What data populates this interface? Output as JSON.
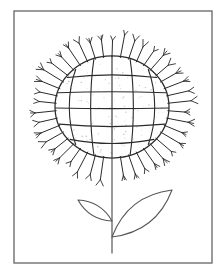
{
  "artwork": {
    "title": "Flower Line Drawing",
    "subject": "sunflower",
    "style": "hand-drawn black ink line art on white paper",
    "caption": "",
    "canvas": {
      "width": 223,
      "height": 276,
      "background": "#ffffff"
    },
    "colors": {
      "ink": "#2b2b2b",
      "ink_light": "#555555",
      "frame": "#6f6f6f",
      "paper": "#ffffff",
      "speckle": "#9a9a9a"
    }
  },
  "frame": {
    "label": "picture border",
    "x": 14,
    "y": 11,
    "width": 198,
    "height": 252,
    "stroke_width": 1.4
  },
  "flower_head": {
    "label": "flower head",
    "center_x": 112,
    "center_y": 107,
    "radius_x": 57,
    "radius_y": 51,
    "stroke_width": 1.1,
    "meridian_count": 4,
    "latitude_count": 4,
    "meridian_offsets": [
      -38,
      -19,
      0,
      19,
      38
    ],
    "latitude_offsets": [
      -31,
      -15,
      1,
      18,
      34
    ],
    "speckle_count": 120
  },
  "petals": {
    "label": "petal ring",
    "count": 42,
    "inner_radius_x": 56,
    "inner_radius_y": 50,
    "length_min": 16,
    "length_max": 24,
    "fork_length": 6,
    "fork_angle_deg": 26,
    "stroke_width": 1.0,
    "gap_start_deg": 84,
    "gap_end_deg": 96
  },
  "stem": {
    "label": "stem",
    "x": 112,
    "top_y": 158,
    "bottom_y": 253,
    "stroke_width": 1.2
  },
  "leaf_left": {
    "label": "small left leaf",
    "tip_x": 78,
    "tip_y": 200,
    "base_x": 112,
    "base_y": 221,
    "bulge": 11,
    "stroke_width": 1.1
  },
  "leaf_right": {
    "label": "large right leaf",
    "tip_x": 172,
    "tip_y": 190,
    "base_x": 112,
    "base_y": 237,
    "bulge": 23,
    "stroke_width": 1.1
  }
}
